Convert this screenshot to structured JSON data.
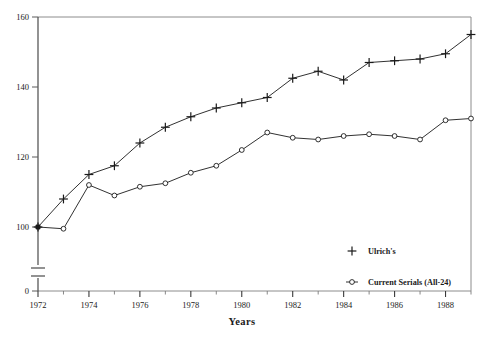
{
  "chart_data": {
    "type": "line",
    "title": "",
    "xlabel": "Years",
    "ylabel": "",
    "xlim": [
      1972,
      1989
    ],
    "ylim": [
      100,
      160
    ],
    "y_axis_break": true,
    "y_break_below": 100,
    "grid": false,
    "legend_position": "bottom-right",
    "y_ticks": [
      0,
      100,
      120,
      140,
      160
    ],
    "y_tick_labels": [
      "0",
      "100",
      "120",
      "140",
      "160"
    ],
    "x_ticks": [
      1972,
      1974,
      1976,
      1978,
      1980,
      1982,
      1984,
      1986,
      1988
    ],
    "x_tick_labels": [
      "1972",
      "1974",
      "1976",
      "1978",
      "1980",
      "1982",
      "1984",
      "1986",
      "1988"
    ],
    "x_minor_ticks": [
      1973,
      1975,
      1977,
      1979,
      1981,
      1983,
      1985,
      1987,
      1989
    ],
    "x": [
      1972,
      1973,
      1974,
      1975,
      1976,
      1977,
      1978,
      1979,
      1980,
      1981,
      1982,
      1983,
      1984,
      1985,
      1986,
      1987,
      1988,
      1989
    ],
    "series": [
      {
        "name": "Ulrich's",
        "marker": "plus",
        "color": "#1a1a1a",
        "values": [
          100.0,
          108.0,
          115.0,
          117.5,
          124.0,
          128.5,
          131.5,
          134.0,
          135.5,
          137.0,
          142.5,
          144.5,
          142.0,
          147.0,
          147.5,
          148.0,
          149.5,
          155.0
        ]
      },
      {
        "name": "Current Serials (All-24)",
        "marker": "circle",
        "color": "#1a1a1a",
        "values": [
          100.0,
          99.5,
          112.0,
          109.0,
          111.5,
          112.5,
          115.5,
          117.5,
          122.0,
          127.0,
          125.5,
          125.0,
          126.0,
          126.5,
          126.0,
          125.0,
          130.5,
          131.0
        ]
      }
    ]
  },
  "legend": {
    "items": [
      {
        "label": "Ulrich's",
        "marker": "plus"
      },
      {
        "label": "Current Serials (All-24)",
        "marker": "circle"
      }
    ]
  }
}
